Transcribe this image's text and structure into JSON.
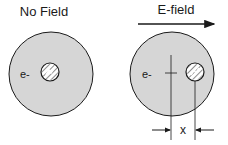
{
  "panels": {
    "left": {
      "title": "No Field",
      "electron_label": "e-"
    },
    "right": {
      "title": "E-field",
      "electron_label": "e-",
      "displacement_label": "x"
    }
  },
  "colors": {
    "cloud_fill": "#d6d6d6",
    "outline": "#1a1a1a",
    "background": "#ffffff"
  }
}
